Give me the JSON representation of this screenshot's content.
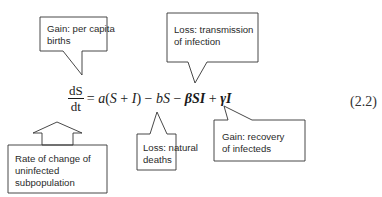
{
  "equation": {
    "lhs_numerator": "dS",
    "lhs_denominator": "dt",
    "terms": [
      {
        "text": "= ",
        "style": "normal"
      },
      {
        "text": "a",
        "style": "italic"
      },
      {
        "text": "(",
        "style": "normal"
      },
      {
        "text": "S",
        "style": "italic"
      },
      {
        "text": " + ",
        "style": "normal"
      },
      {
        "text": "I",
        "style": "italic"
      },
      {
        "text": ") − ",
        "style": "normal"
      },
      {
        "text": "bS",
        "style": "italic"
      },
      {
        "text": " − ",
        "style": "normal"
      },
      {
        "text": "βSI",
        "style": "bold"
      },
      {
        "text": " + ",
        "style": "normal"
      },
      {
        "text": "γI",
        "style": "bold"
      }
    ],
    "number": "(2.2)"
  },
  "callouts": {
    "per_capita_births": {
      "line1": "Gain: per capita",
      "line2": "births"
    },
    "transmission": {
      "line1": "Loss: transmission",
      "line2": "of infection"
    },
    "rate_of_change": {
      "line1": "Rate of change of",
      "line2": "uninfected",
      "line3": "subpopulation"
    },
    "natural_deaths": {
      "line1": "Loss: natural",
      "line2": "deaths"
    },
    "recovery": {
      "line1": "Gain: recovery",
      "line2": "of infecteds"
    }
  },
  "colors": {
    "stroke": "#333333",
    "text": "#2a2a2a",
    "background": "#ffffff"
  }
}
